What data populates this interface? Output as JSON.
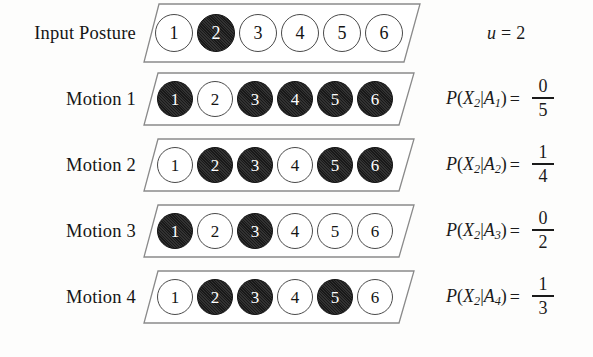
{
  "figure": {
    "background_color": "#fdfdfc",
    "ink_color": "#1a1a1a",
    "filled_node_color": "#191919",
    "empty_node_color": "#ffffff"
  },
  "input_row": {
    "label": "Input Posture",
    "nodes": [
      {
        "number": "1",
        "filled": false
      },
      {
        "number": "2",
        "filled": true
      },
      {
        "number": "3",
        "filled": false
      },
      {
        "number": "4",
        "filled": false
      },
      {
        "number": "5",
        "filled": false
      },
      {
        "number": "6",
        "filled": true
      }
    ],
    "annotation": {
      "variable": "u",
      "equals": "=",
      "value": "2"
    }
  },
  "motions": [
    {
      "label": "Motion 1",
      "nodes": [
        {
          "number": "1",
          "filled": true
        },
        {
          "number": "2",
          "filled": false
        },
        {
          "number": "3",
          "filled": true
        },
        {
          "number": "4",
          "filled": true
        },
        {
          "number": "5",
          "filled": true
        },
        {
          "number": "6",
          "filled": true
        }
      ],
      "formula": {
        "p": "P",
        "open": "(",
        "x": "X",
        "x_sub": "2",
        "mid": "|",
        "a": "A",
        "a_sub": "1",
        "close": ")",
        "equals": "=",
        "numerator": "0",
        "denominator": "5"
      }
    },
    {
      "label": "Motion 2",
      "nodes": [
        {
          "number": "1",
          "filled": false
        },
        {
          "number": "2",
          "filled": true
        },
        {
          "number": "3",
          "filled": true
        },
        {
          "number": "4",
          "filled": false
        },
        {
          "number": "5",
          "filled": true
        },
        {
          "number": "6",
          "filled": true
        }
      ],
      "formula": {
        "p": "P",
        "open": "(",
        "x": "X",
        "x_sub": "2",
        "mid": "|",
        "a": "A",
        "a_sub": "2",
        "close": ")",
        "equals": "=",
        "numerator": "1",
        "denominator": "4"
      }
    },
    {
      "label": "Motion 3",
      "nodes": [
        {
          "number": "1",
          "filled": true
        },
        {
          "number": "2",
          "filled": false
        },
        {
          "number": "3",
          "filled": true
        },
        {
          "number": "4",
          "filled": false
        },
        {
          "number": "5",
          "filled": false
        },
        {
          "number": "6",
          "filled": false
        }
      ],
      "formula": {
        "p": "P",
        "open": "(",
        "x": "X",
        "x_sub": "2",
        "mid": "|",
        "a": "A",
        "a_sub": "3",
        "close": ")",
        "equals": "=",
        "numerator": "0",
        "denominator": "2"
      }
    },
    {
      "label": "Motion 4",
      "nodes": [
        {
          "number": "1",
          "filled": false
        },
        {
          "number": "2",
          "filled": true
        },
        {
          "number": "3",
          "filled": true
        },
        {
          "number": "4",
          "filled": false
        },
        {
          "number": "5",
          "filled": true
        },
        {
          "number": "6",
          "filled": false
        }
      ],
      "formula": {
        "p": "P",
        "open": "(",
        "x": "X",
        "x_sub": "2",
        "mid": "|",
        "a": "A",
        "a_sub": "4",
        "close": ")",
        "equals": "=",
        "numerator": "1",
        "denominator": "3"
      }
    }
  ]
}
